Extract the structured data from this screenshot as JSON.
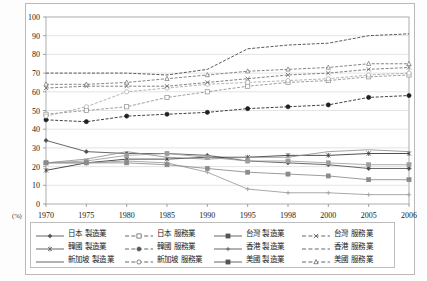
{
  "figure": {
    "unit_label": "(%)",
    "plot_bg": "#ffffff",
    "grid_color": "#c8c8c8",
    "frame_color": "#9a9a9a"
  },
  "chart_data": {
    "type": "line",
    "title": "",
    "subtitle": "",
    "xlabel": "",
    "ylabel": "",
    "unit": "(%)",
    "grid": true,
    "legend_position": "bottom",
    "ylim": [
      0,
      100
    ],
    "yticks": [
      0,
      10,
      20,
      30,
      40,
      50,
      60,
      70,
      80,
      90,
      100
    ],
    "categories": [
      "1970",
      "1975",
      "1980",
      "1985",
      "1990",
      "1995",
      "1998",
      "2000",
      "2005",
      "2006"
    ],
    "x": [
      1970,
      1975,
      1980,
      1985,
      1990,
      1995,
      1998,
      2000,
      2005,
      2006
    ],
    "series": [
      {
        "name": "日本 製造業",
        "marker": "diamond",
        "line": "solid",
        "color": "#4d4d4d",
        "values": [
          34,
          28,
          27,
          27,
          26,
          23,
          22,
          21,
          19,
          19
        ]
      },
      {
        "name": "日本 服務業",
        "marker": "square-open",
        "line": "dashed",
        "color": "#8c8c8c",
        "values": [
          48,
          50,
          52,
          57,
          60,
          63,
          65,
          66,
          68,
          69
        ]
      },
      {
        "name": "韓國 製造業",
        "marker": "asterisk",
        "line": "solid",
        "color": "#2e2e2e",
        "values": [
          18,
          22,
          24,
          24,
          25,
          25,
          26,
          26,
          27,
          27
        ]
      },
      {
        "name": "韓國 服務業",
        "marker": "circle-filled",
        "line": "dashed",
        "color": "#1f1f1f",
        "values": [
          45,
          44,
          47,
          48,
          49,
          51,
          52,
          53,
          57,
          58
        ]
      },
      {
        "name": "新加坡 製造業",
        "marker": "none",
        "line": "solid",
        "color": "#8f8f8f",
        "values": [
          22,
          24,
          28,
          25,
          24,
          25,
          25,
          28,
          29,
          28
        ]
      },
      {
        "name": "新加坡 服務業",
        "marker": "circle-open",
        "line": "dashed",
        "color": "#a6a6a6",
        "values": [
          47,
          52,
          60,
          62,
          64,
          65,
          66,
          67,
          69,
          70
        ]
      },
      {
        "name": "台灣 製造業",
        "marker": "square-small",
        "line": "solid",
        "color": "#9d9d9d",
        "values": [
          22,
          23,
          26,
          27,
          25,
          23,
          23,
          22,
          21,
          21
        ]
      },
      {
        "name": "台灣 服務業",
        "marker": "x-cross",
        "line": "dashed",
        "color": "#6b6b6b",
        "values": [
          62,
          63,
          63,
          63,
          65,
          67,
          69,
          70,
          72,
          73
        ]
      },
      {
        "name": "香港 製造業",
        "marker": "plus",
        "line": "solid",
        "color": "#9a9a9a",
        "values": [
          22,
          22,
          23,
          22,
          17,
          8,
          6,
          6,
          5,
          5
        ]
      },
      {
        "name": "香港 服務業",
        "marker": "none",
        "line": "dashed",
        "color": "#3a3a3a",
        "values": [
          70,
          70,
          70,
          69,
          72,
          83,
          85,
          86,
          90,
          91
        ]
      },
      {
        "name": "美國 製造業",
        "marker": "square-grey",
        "line": "solid",
        "color": "#8a8a8a",
        "values": [
          22,
          22,
          22,
          21,
          19,
          17,
          16,
          15,
          13,
          13
        ]
      },
      {
        "name": "美國 服務業",
        "marker": "triangle-open",
        "line": "dashed",
        "color": "#707070",
        "values": [
          64,
          64,
          65,
          67,
          69,
          71,
          72,
          73,
          75,
          75
        ]
      }
    ]
  },
  "legend": {
    "rows": [
      [
        {
          "name": "日本 製造業",
          "key": "solid-diamond"
        },
        {
          "name": "日本 服務業",
          "key": "dashed-square-open"
        },
        {
          "name": "台灣 製造業",
          "key": "solid-square-small"
        },
        {
          "name": "台灣 服務業",
          "key": "dashed-x-cross"
        }
      ],
      [
        {
          "name": "韓國 製造業",
          "key": "solid-asterisk"
        },
        {
          "name": "韓國 服務業",
          "key": "dashed-circle-filled"
        },
        {
          "name": "香港 製造業",
          "key": "solid-plus"
        },
        {
          "name": "香港 服務業",
          "key": "dashed-plain"
        }
      ],
      [
        {
          "name": "新加坡 製造業",
          "key": "solid-plain"
        },
        {
          "name": "新加坡 服務業",
          "key": "dashed-circle-open"
        },
        {
          "name": "美國 製造業",
          "key": "solid-square-grey"
        },
        {
          "name": "美國 服務業",
          "key": "dashed-triangle-open"
        }
      ]
    ]
  }
}
